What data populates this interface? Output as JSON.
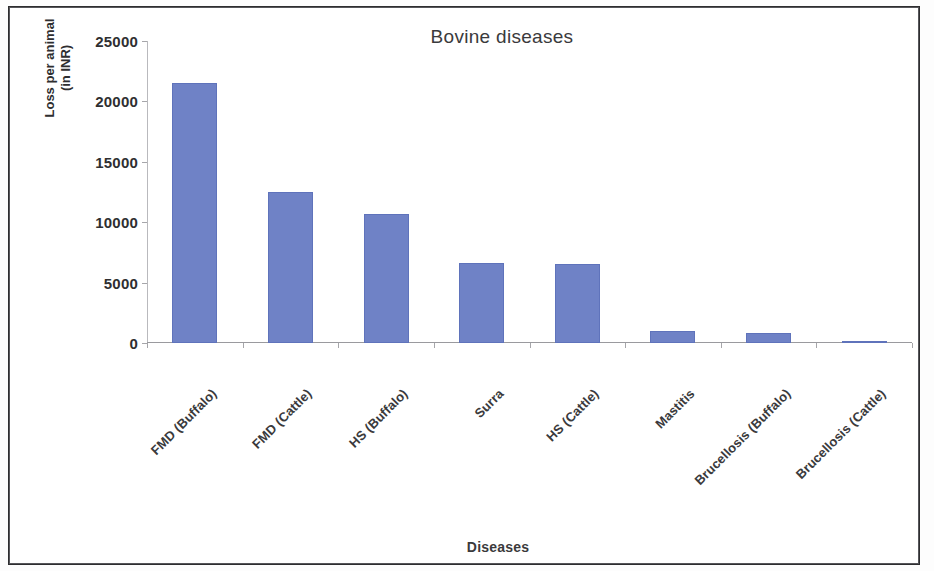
{
  "frame": {
    "border_color": "#2e2e30"
  },
  "chart_data": {
    "type": "bar",
    "title": "Bovine diseases",
    "xlabel": "Diseases",
    "ylabel": "Loss per animal",
    "ylabel_line1": "Loss per animal",
    "ylabel_line2": "(in INR)",
    "ylabel_units": "(in INR)",
    "categories": [
      "FMD (Buffalo)",
      "FMD (Cattle)",
      "HS (Buffalo)",
      "Surra",
      "HS (Cattle)",
      "Mastitis",
      "Brucellosis (Buffalo)",
      "Brucellosis (Cattle)"
    ],
    "values": [
      21500,
      12500,
      10700,
      6600,
      6500,
      1000,
      800,
      180
    ],
    "ylim": [
      0,
      25000
    ],
    "yticks": [
      0,
      5000,
      10000,
      15000,
      20000,
      25000
    ],
    "ytick_labels": [
      "0",
      "5000",
      "10000",
      "15000",
      "20000",
      "25000"
    ],
    "grid": false,
    "legend": false,
    "bar_color": "#6f82c6",
    "axis_color": "#9a9a9e"
  }
}
